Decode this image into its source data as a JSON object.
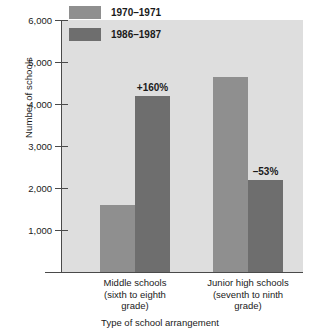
{
  "chart_data": {
    "type": "bar",
    "title": "",
    "xlabel": "Type of school arrangement",
    "ylabel": "Number of schools",
    "categories": [
      "Middle schools (sixth to eighth grade)",
      "Junior high schools (seventh to ninth grade)"
    ],
    "category_lines": [
      [
        "Middle schools",
        "(sixth to eighth",
        "grade)"
      ],
      [
        "Junior high schools",
        "(seventh to ninth",
        "grade)"
      ]
    ],
    "series": [
      {
        "name": "1970–1971",
        "color": "#8f8f8f",
        "values": [
          1600,
          4650
        ]
      },
      {
        "name": "1986–1987",
        "color": "#6e6e6e",
        "values": [
          4200,
          2200
        ]
      }
    ],
    "annotations": [
      {
        "text": "+160%",
        "category_index": 0,
        "series_index": 1,
        "value": 4200
      },
      {
        "text": "–53%",
        "category_index": 1,
        "series_index": 1,
        "value": 2200
      }
    ],
    "ylim": [
      0,
      6000
    ],
    "yticks": [
      1000,
      2000,
      3000,
      4000,
      5000,
      6000
    ],
    "ytick_labels": [
      "1,000",
      "2,000",
      "3,000",
      "4,000",
      "5,000",
      "6,000"
    ],
    "grid": false,
    "legend_position": "top-left-inside",
    "plot_background": "#dedede"
  }
}
